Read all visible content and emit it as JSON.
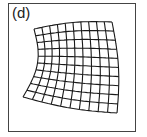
{
  "panel": {
    "label": "(d)",
    "frame_color": "#444444",
    "line_color": "#1a1a1a"
  },
  "grid": {
    "description": "Warped (distorted) rectangular mesh grid",
    "columns": 10,
    "rows": 10,
    "corners": {
      "top_left": [
        34,
        29
      ],
      "top_right": [
        112,
        22
      ],
      "bottom_left": [
        23,
        97
      ],
      "bottom_right": [
        117,
        113
      ]
    }
  }
}
